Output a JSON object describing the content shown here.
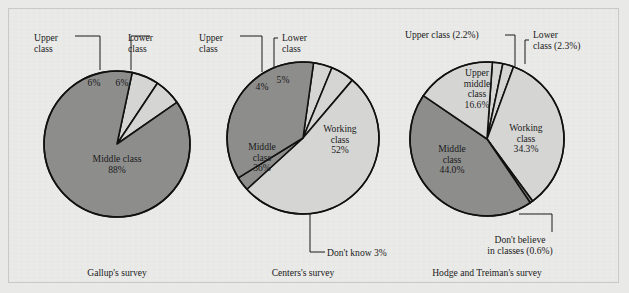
{
  "figure": {
    "background_color": "#e9e9e7",
    "frame_color": "#c9c9c6",
    "outline_color": "#111111",
    "palette": {
      "dark_gray": "#8d8d8c",
      "light_gray": "#d5d5d3"
    }
  },
  "chart_data": [
    {
      "type": "pie",
      "title": "Gallup's survey",
      "caption": "Gallup's survey",
      "center": {
        "x": 117,
        "y": 144
      },
      "radius": 73,
      "start_angle_deg": -78,
      "categories": [
        "Upper class",
        "Lower class",
        "Middle class"
      ],
      "values": [
        6,
        6,
        88
      ],
      "slices": [
        {
          "label": "Upper class",
          "value": 6,
          "value_text": "6%",
          "color": "#d5d5d3",
          "inside_text": [
            "6%"
          ],
          "inside_x": 94,
          "inside_y": 86,
          "callout": {
            "lines": [
              "Upper",
              "class"
            ],
            "x": 34,
            "y": 41,
            "leader": "M 75,36 L 100,36 L 100,70",
            "anchor": "start"
          }
        },
        {
          "label": "Lower class",
          "value": 6,
          "value_text": "6%",
          "color": "#d5d5d3",
          "inside_text": [
            "6%"
          ],
          "inside_x": 122,
          "inside_y": 86,
          "callout": {
            "lines": [
              "Lower",
              "class"
            ],
            "x": 128,
            "y": 41,
            "leader": "M 150,36 L 131,36 L 131,70",
            "anchor": "start"
          }
        },
        {
          "label": "Middle class",
          "value": 88,
          "value_text": "88%",
          "color": "#8d8d8c",
          "inside_text": [
            "Middle class",
            "88%"
          ],
          "inside_x": 117,
          "inside_y": 162,
          "callout": null
        }
      ]
    },
    {
      "type": "pie",
      "title": "Centers's survey",
      "caption": "Centers's survey",
      "center": {
        "x": 303,
        "y": 138
      },
      "radius": 76,
      "start_angle_deg": -82,
      "categories": [
        "Upper class",
        "Lower class",
        "Working class",
        "Don't know",
        "Middle class"
      ],
      "values": [
        4,
        5,
        52,
        3,
        36
      ],
      "slices": [
        {
          "label": "Upper class",
          "value": 4,
          "value_text": "4%",
          "color": "#d5d5d3",
          "inside_text": [
            "4%"
          ],
          "inside_x": 262,
          "inside_y": 90,
          "callout": {
            "lines": [
              "Upper",
              "class"
            ],
            "x": 199,
            "y": 41,
            "leader": "M 240,36 L 262,36 L 262,72",
            "anchor": "start"
          }
        },
        {
          "label": "Lower class",
          "value": 5,
          "value_text": "5%",
          "color": "#d5d5d3",
          "inside_text": [
            "5%"
          ],
          "inside_x": 283,
          "inside_y": 83,
          "callout": {
            "lines": [
              "Lower",
              "class"
            ],
            "x": 282,
            "y": 41,
            "leader": "M 278,38 L 274,38 L 274,68",
            "anchor": "start"
          }
        },
        {
          "label": "Working class",
          "value": 52,
          "value_text": "52%",
          "color": "#d5d5d3",
          "inside_text": [
            "Working",
            "class",
            "52%"
          ],
          "inside_x": 340,
          "inside_y": 132,
          "callout": null
        },
        {
          "label": "Don't know",
          "value": 3,
          "value_text": "3%",
          "color": "#8d8d8c",
          "inside_text": [],
          "inside_x": 0,
          "inside_y": 0,
          "callout": {
            "lines": [
              "Don't know 3%"
            ],
            "x": 327,
            "y": 256,
            "leader": "M 310,214 L 310,252 L 325,252",
            "anchor": "start"
          }
        },
        {
          "label": "Middle class",
          "value": 36,
          "value_text": "36%",
          "color": "#8d8d8c",
          "inside_text": [
            "Middle",
            "class",
            "36%"
          ],
          "inside_x": 262,
          "inside_y": 150,
          "callout": null
        }
      ]
    },
    {
      "type": "pie",
      "title": "Hodge and Treiman's survey",
      "caption": "Hodge and Treiman's survey",
      "center": {
        "x": 487,
        "y": 139
      },
      "radius": 77,
      "start_angle_deg": -86,
      "categories": [
        "Upper class",
        "Lower class",
        "Working class",
        "Don't believe in classes",
        "Middle class",
        "Upper middle class"
      ],
      "values": [
        2.2,
        2.3,
        34.3,
        0.6,
        44.0,
        16.6
      ],
      "slices": [
        {
          "label": "Upper class",
          "value": 2.2,
          "value_text": "2.2%",
          "color": "#d5d5d3",
          "inside_text": [],
          "inside_x": 0,
          "inside_y": 0,
          "callout": {
            "lines": [
              "Upper class (2.2%)"
            ],
            "x": 405,
            "y": 38,
            "leader": "M 505,35 L 515,35 L 515,66",
            "anchor": "start"
          }
        },
        {
          "label": "Lower class",
          "value": 2.3,
          "value_text": "2.3%",
          "color": "#d5d5d3",
          "inside_text": [],
          "inside_x": 0,
          "inside_y": 0,
          "callout": {
            "lines": [
              "Lower",
              "class (2.3%)"
            ],
            "x": 533,
            "y": 38,
            "leader": "M 529,40 L 525,40 L 525,64",
            "anchor": "start"
          }
        },
        {
          "label": "Working class",
          "value": 34.3,
          "value_text": "34.3%",
          "color": "#d5d5d3",
          "inside_text": [
            "Working",
            "class",
            "34.3%"
          ],
          "inside_x": 526,
          "inside_y": 131,
          "callout": null
        },
        {
          "label": "Don't believe in classes",
          "value": 0.6,
          "value_text": "0.6%",
          "color": "#8d8d8c",
          "inside_text": [],
          "inside_x": 0,
          "inside_y": 0,
          "callout": {
            "lines": [
              "Don't believe",
              "in classes (0.6%)"
            ],
            "x": 520,
            "y": 243,
            "leader": "M 519,214 L 552,214 L 552,232",
            "anchor": "middle"
          }
        },
        {
          "label": "Middle class",
          "value": 44.0,
          "value_text": "44.0%",
          "color": "#8d8d8c",
          "inside_text": [
            "Middle",
            "class",
            "44.0%"
          ],
          "inside_x": 452,
          "inside_y": 152,
          "callout": null
        },
        {
          "label": "Upper middle class",
          "value": 16.6,
          "value_text": "16.6%",
          "color": "#d5d5d3",
          "inside_text": [
            "Upper",
            "middle",
            "class",
            "16.6%"
          ],
          "inside_x": 477,
          "inside_y": 76,
          "callout": null
        }
      ]
    }
  ],
  "captions": [
    {
      "text": "Gallup's survey",
      "x": 117,
      "y": 276
    },
    {
      "text": "Centers's survey",
      "x": 303,
      "y": 276
    },
    {
      "text": "Hodge and Treiman's survey",
      "x": 487,
      "y": 276
    }
  ]
}
